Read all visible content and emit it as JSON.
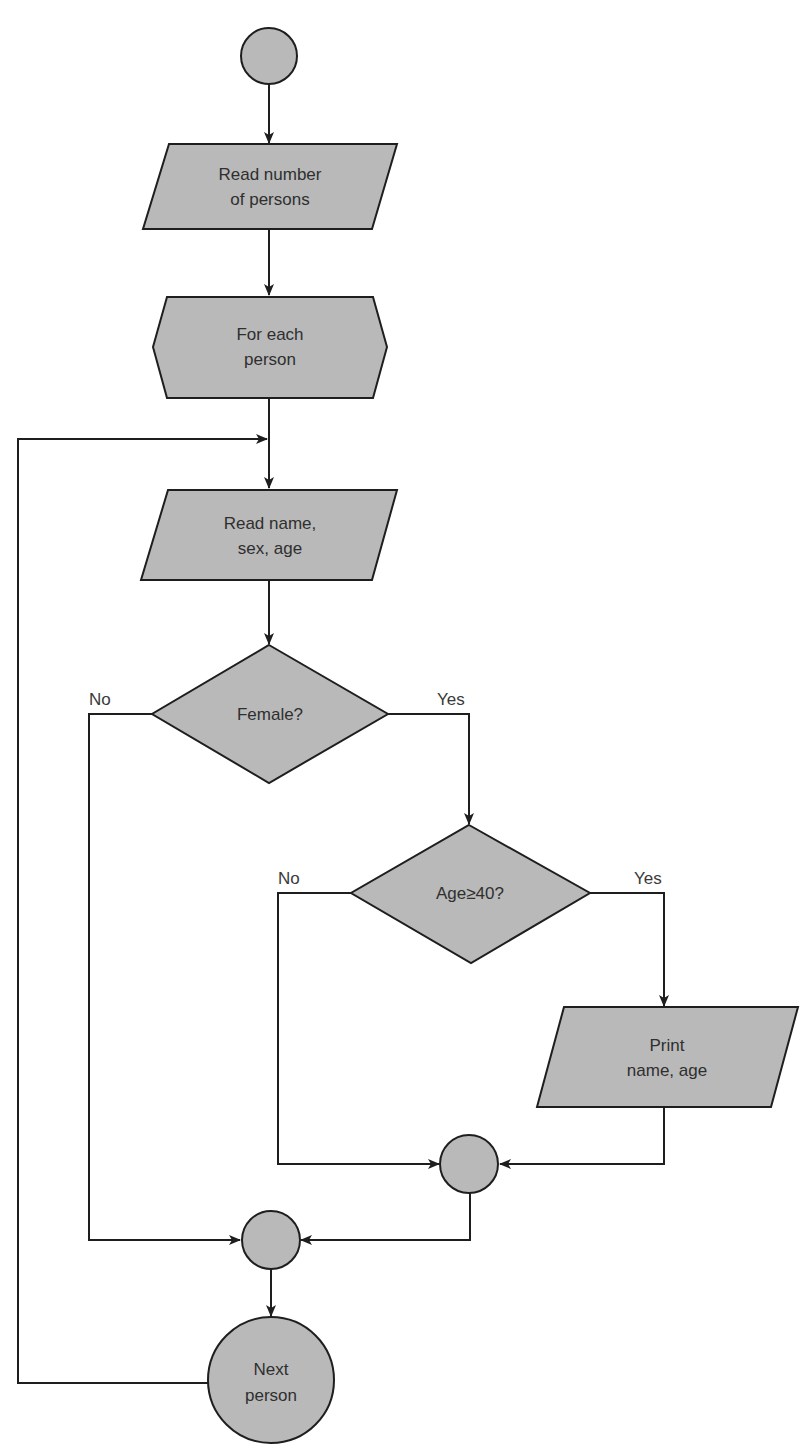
{
  "diagram": {
    "type": "flowchart",
    "colors": {
      "shape_fill": "#b9b9b9",
      "stroke": "#1e1e1e",
      "text": "#2f2f2f",
      "background": "#ffffff"
    },
    "nodes": {
      "start": {
        "shape": "circle",
        "lines": []
      },
      "read_count": {
        "shape": "parallelogram",
        "lines": [
          "Read number",
          "of persons"
        ]
      },
      "loop": {
        "shape": "hexagon",
        "lines": [
          "For each",
          "person"
        ]
      },
      "read_person": {
        "shape": "parallelogram",
        "lines": [
          "Read name,",
          "sex, age"
        ]
      },
      "female": {
        "shape": "diamond",
        "lines": [
          "Female?"
        ]
      },
      "age_check": {
        "shape": "diamond",
        "lines": [
          "Age≥40?"
        ]
      },
      "print": {
        "shape": "parallelogram",
        "lines": [
          "Print",
          "name, age"
        ]
      },
      "join_inner": {
        "shape": "circle",
        "lines": []
      },
      "join_outer": {
        "shape": "circle",
        "lines": []
      },
      "next": {
        "shape": "circle",
        "lines": [
          "Next",
          "person"
        ]
      }
    },
    "edge_labels": {
      "female_no": "No",
      "female_yes": "Yes",
      "age_no": "No",
      "age_yes": "Yes"
    },
    "edges": [
      {
        "from": "start",
        "to": "read_count"
      },
      {
        "from": "read_count",
        "to": "loop"
      },
      {
        "from": "loop",
        "to": "read_person"
      },
      {
        "from": "read_person",
        "to": "female"
      },
      {
        "from": "female",
        "to": "age_check",
        "label": "Yes"
      },
      {
        "from": "female",
        "to": "join_outer",
        "label": "No"
      },
      {
        "from": "age_check",
        "to": "print",
        "label": "Yes"
      },
      {
        "from": "age_check",
        "to": "join_inner",
        "label": "No"
      },
      {
        "from": "print",
        "to": "join_inner"
      },
      {
        "from": "join_inner",
        "to": "join_outer"
      },
      {
        "from": "join_outer",
        "to": "next"
      },
      {
        "from": "next",
        "to": "read_person",
        "label": "loop back"
      }
    ]
  }
}
